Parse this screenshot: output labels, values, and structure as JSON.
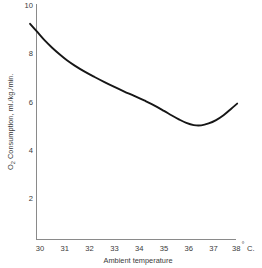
{
  "chart_data": {
    "type": "line",
    "title": "",
    "subtitle": "",
    "xlabel": "Ambient temperature",
    "ylabel": "O2 Consumption, ml./kg./min.",
    "ylabel_parts": {
      "lead": "O",
      "subscript": "2",
      "rest": " Consumption, ml./kg./min."
    },
    "x_unit_label": "38° C.",
    "x_unit_parts": {
      "value": "38",
      "degree": "°",
      "unit": "C."
    },
    "xlim": [
      29.1,
      38.2
    ],
    "ylim": [
      0,
      10.4
    ],
    "xticks": [
      30,
      31,
      32,
      33,
      34,
      35,
      36,
      37,
      38
    ],
    "xtick_labels": [
      "30",
      "31",
      "32",
      "33",
      "34",
      "35",
      "36",
      "37",
      "38"
    ],
    "yticks": [
      2,
      4,
      6,
      8,
      10
    ],
    "ytick_labels": [
      "2",
      "4",
      "6",
      "8",
      "10"
    ],
    "grid": false,
    "legend": false,
    "legend_position": "none",
    "series": [
      {
        "name": "O2 consumption vs ambient temperature",
        "color": "#161616",
        "x": [
          29.6,
          29.9,
          30.2,
          30.5,
          30.8,
          31.1,
          31.4,
          31.8,
          32.2,
          32.6,
          33.0,
          33.4,
          33.8,
          34.2,
          34.6,
          35.0,
          35.3,
          35.6,
          35.9,
          36.2,
          36.5,
          36.8,
          37.1,
          37.4,
          37.7,
          37.95
        ],
        "y": [
          9.2,
          8.85,
          8.5,
          8.2,
          7.93,
          7.68,
          7.47,
          7.22,
          7.0,
          6.79,
          6.59,
          6.4,
          6.22,
          6.03,
          5.83,
          5.6,
          5.42,
          5.25,
          5.1,
          5.01,
          5.0,
          5.08,
          5.22,
          5.42,
          5.68,
          5.9
        ]
      }
    ],
    "annotations": [],
    "axis_color": "#8a8a8a",
    "text_color": "#3a3a3a",
    "background_color": "#ffffff"
  },
  "figure": {
    "name": "o2-consumption-vs-ambient-temperature-chart"
  }
}
